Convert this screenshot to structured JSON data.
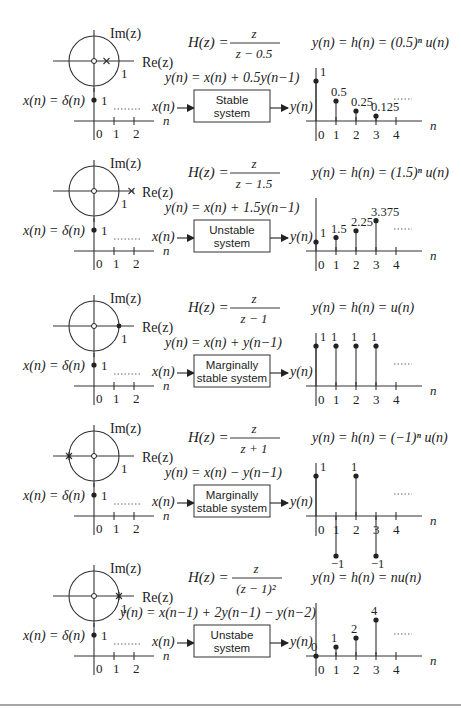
{
  "figure": {
    "panels": [
      {
        "id": "stable",
        "y0": 0,
        "pole_plot": {
          "im_label": "Im(z)",
          "re_label": "Re(z)",
          "unit_label": "1",
          "pole_type": "cross",
          "pole_x": 0.5
        },
        "transfer": {
          "lhs": "H(z) =",
          "num": "z",
          "den": "z − 0.5"
        },
        "difference_eq": "y(n) = x(n) + 0.5y(n−1)",
        "system_box": {
          "line1": "Stable",
          "line2": "system",
          "font": "sans"
        },
        "input": {
          "label": "x(n) = δ(n)",
          "value_label": "1",
          "ticks": [
            "0",
            "1",
            "2"
          ],
          "axis": "n"
        },
        "io": {
          "in": "x(n)",
          "out": "y(n)"
        },
        "response_title": "y(n) = h(n) = (0.5)ⁿ u(n)",
        "response": {
          "n": [
            0,
            1,
            2,
            3
          ],
          "values": [
            1,
            0.5,
            0.25,
            0.125
          ],
          "labels": [
            "1",
            "0.5",
            "0.25",
            "0.125"
          ],
          "ticks": [
            "0",
            "1",
            "2",
            "3",
            "4"
          ],
          "axis": "n"
        }
      },
      {
        "id": "unstable",
        "y0": 130,
        "pole_plot": {
          "im_label": "Im(z)",
          "re_label": "Re(z)",
          "unit_label": "1",
          "pole_type": "cross",
          "pole_x": 1.5
        },
        "transfer": {
          "lhs": "H(z) =",
          "num": "z",
          "den": "z − 1.5"
        },
        "difference_eq": "y(n) = x(n) + 1.5y(n−1)",
        "system_box": {
          "line1": "Unstable",
          "line2": "system",
          "font": "sans"
        },
        "input": {
          "label": "x(n) = δ(n)",
          "value_label": "1",
          "ticks": [
            "0",
            "1",
            "2"
          ],
          "axis": "n"
        },
        "io": {
          "in": "x(n)",
          "out": "y(n)"
        },
        "response_title": "y(n) = h(n) = (1.5)ⁿ u(n)",
        "response": {
          "n": [
            0,
            1,
            2,
            3
          ],
          "values": [
            1,
            1.5,
            2.25,
            3.375
          ],
          "labels": [
            "1",
            "1.5",
            "2.25",
            "3.375"
          ],
          "ticks": [
            "0",
            "1",
            "2",
            "3",
            "4"
          ],
          "axis": "n"
        }
      },
      {
        "id": "marginal-1",
        "y0": 265,
        "pole_plot": {
          "im_label": "Im(z)",
          "re_label": "Re(z)",
          "unit_label": "1",
          "pole_type": "dot",
          "pole_x": 1
        },
        "transfer": {
          "lhs": "H(z) =",
          "num": "z",
          "den": "z − 1"
        },
        "difference_eq": "y(n) = x(n) + y(n−1)",
        "system_box": {
          "line1": "Marginally",
          "line2": "stable system",
          "font": "sans"
        },
        "input": {
          "label": "x(n) = δ(n)",
          "value_label": "1",
          "ticks": [
            "0",
            "1",
            "2"
          ],
          "axis": "n"
        },
        "io": {
          "in": "x(n)",
          "out": "y(n)"
        },
        "response_title": "y(n) = h(n) = u(n)",
        "response": {
          "n": [
            0,
            1,
            2,
            3
          ],
          "values": [
            1,
            1,
            1,
            1
          ],
          "labels": [
            "1",
            "1",
            "1",
            "1"
          ],
          "ticks": [
            "0",
            "1",
            "2",
            "3",
            "4"
          ],
          "axis": "n"
        }
      },
      {
        "id": "marginal-2",
        "y0": 395,
        "pole_plot": {
          "im_label": "Im(z)",
          "re_label": "Re(z)",
          "unit_label": "1",
          "pole_type": "star",
          "pole_x": -1
        },
        "transfer": {
          "lhs": "H(z) =",
          "num": "z",
          "den": "z + 1"
        },
        "difference_eq": "y(n) = x(n) − y(n−1)",
        "system_box": {
          "line1": "Marginally",
          "line2": "stable system",
          "font": "sans"
        },
        "input": {
          "label": "x(n) = δ(n)",
          "value_label": "1",
          "ticks": [
            "0",
            "1",
            "2"
          ],
          "axis": "n"
        },
        "io": {
          "in": "x(n)",
          "out": "y(n)"
        },
        "response_title": "y(n) = h(n) = (−1)ⁿ u(n)",
        "response": {
          "n": [
            0,
            1,
            2,
            3
          ],
          "values": [
            1,
            -1,
            1,
            -1
          ],
          "labels": [
            "1",
            "−1",
            "1",
            "−1"
          ],
          "ticks": [
            "0",
            "1",
            "2",
            "3",
            "4"
          ],
          "axis": "n"
        }
      },
      {
        "id": "unstable-double",
        "y0": 535,
        "pole_plot": {
          "im_label": "Im(z)",
          "re_label": "Re(z)",
          "unit_label": "1",
          "pole_type": "double",
          "pole_x": 1
        },
        "transfer": {
          "lhs": "H(z) =",
          "num": "z",
          "den": "(z − 1)²"
        },
        "difference_eq": "y(n) = x(n−1) + 2y(n−1) − y(n−2)",
        "system_box": {
          "line1": "Unstabe",
          "line2": "system",
          "font": "sans"
        },
        "input": {
          "label": "x(n) = δ(n)",
          "value_label": "1",
          "ticks": [
            "0",
            "1",
            "2"
          ],
          "axis": "n"
        },
        "io": {
          "in": "x(n)",
          "out": "y(n)"
        },
        "response_title": "y(n) = h(n) = nu(n)",
        "response": {
          "n": [
            0,
            1,
            2,
            3
          ],
          "values": [
            0,
            1,
            2,
            4
          ],
          "labels": [
            "0",
            "1",
            "2",
            "4"
          ],
          "ticks": [
            "0",
            "1",
            "2",
            "3",
            "4"
          ],
          "axis": "n"
        }
      }
    ]
  },
  "chart_data": [
    {
      "type": "scatter",
      "title": "y(n) = h(n) = (0.5)^n u(n)",
      "xlabel": "n",
      "x": [
        0,
        1,
        2,
        3
      ],
      "values": [
        1,
        0.5,
        0.25,
        0.125
      ]
    },
    {
      "type": "scatter",
      "title": "y(n) = h(n) = (1.5)^n u(n)",
      "xlabel": "n",
      "x": [
        0,
        1,
        2,
        3
      ],
      "values": [
        1,
        1.5,
        2.25,
        3.375
      ]
    },
    {
      "type": "scatter",
      "title": "y(n) = h(n) = u(n)",
      "xlabel": "n",
      "x": [
        0,
        1,
        2,
        3
      ],
      "values": [
        1,
        1,
        1,
        1
      ]
    },
    {
      "type": "scatter",
      "title": "y(n) = h(n) = (-1)^n u(n)",
      "xlabel": "n",
      "x": [
        0,
        1,
        2,
        3
      ],
      "values": [
        1,
        -1,
        1,
        -1
      ]
    },
    {
      "type": "scatter",
      "title": "y(n) = h(n) = nu(n)",
      "xlabel": "n",
      "x": [
        0,
        1,
        2,
        3
      ],
      "values": [
        0,
        1,
        2,
        4
      ]
    }
  ]
}
